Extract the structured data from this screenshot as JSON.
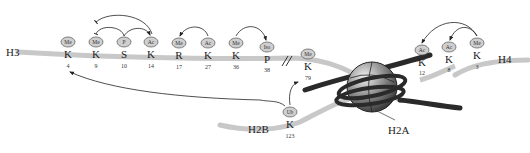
{
  "diagram": {
    "histones": {
      "H3": {
        "label": "H3",
        "sites": [
          {
            "residue": "K",
            "position": "4",
            "mod": "Me"
          },
          {
            "residue": "K",
            "position": "9",
            "mod": "Me"
          },
          {
            "residue": "S",
            "position": "10",
            "mod": "P"
          },
          {
            "residue": "K",
            "position": "14",
            "mod": "Ac"
          },
          {
            "residue": "R",
            "position": "17",
            "mod": "Me"
          },
          {
            "residue": "K",
            "position": "27",
            "mod": "Ac"
          },
          {
            "residue": "K",
            "position": "36",
            "mod": "Me"
          },
          {
            "residue": "P",
            "position": "38",
            "mod": "Iso"
          },
          {
            "residue": "K",
            "position": "79",
            "mod": "Me"
          }
        ]
      },
      "H4": {
        "label": "H4",
        "sites": [
          {
            "residue": "K",
            "position": "12",
            "mod": "Ac"
          },
          {
            "residue": "K",
            "position": "8",
            "mod": "Ac"
          },
          {
            "residue": "K",
            "position": "3",
            "mod": "Me"
          }
        ]
      },
      "H2B": {
        "label": "H2B",
        "sites": [
          {
            "residue": "K",
            "position": "123",
            "mod": "Ub"
          }
        ]
      },
      "H2A": {
        "label": "H2A"
      }
    },
    "crosstalk": [
      {
        "from": "H3S10 P",
        "to": "H3K14 Ac",
        "type": "activating"
      },
      {
        "from": "H3S10 P",
        "to": "H3K9 Me",
        "type": "inhibitory"
      },
      {
        "from": "H3K14 Ac",
        "to": "H3K9 Me",
        "type": "inhibitory"
      },
      {
        "from": "H3K27 Ac",
        "to": "H3R17 Me",
        "type": "activating"
      },
      {
        "from": "H3K36 Me",
        "to": "H3P38 Iso",
        "type": "activating"
      },
      {
        "from": "H4K3 Me",
        "to": "H4K12 Ac",
        "type": "activating"
      },
      {
        "from": "H4K3 Me",
        "to": "H4K8 Ac",
        "type": "activating"
      },
      {
        "from": "H2BK123 Ub",
        "to": "H3K4 Me",
        "type": "activating"
      },
      {
        "from": "H2BK123 Ub",
        "to": "H3K79 Me",
        "type": "activating"
      }
    ],
    "colors": {
      "tail": "#c8c8c8",
      "mod_fill": "#cfcfcf",
      "mod_stroke": "#555555",
      "dna": "#2a2a2a",
      "arrow": "#222222"
    }
  }
}
